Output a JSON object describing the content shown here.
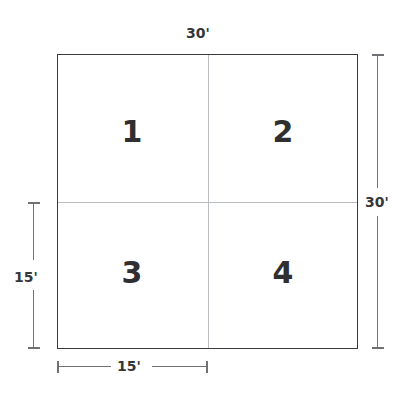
{
  "diagram": {
    "type": "floor-plan-quadrant-square",
    "shape": "square",
    "quadrants": [
      {
        "id": "1",
        "label": "1",
        "position": "top-left"
      },
      {
        "id": "2",
        "label": "2",
        "position": "top-right"
      },
      {
        "id": "3",
        "label": "3",
        "position": "bottom-left"
      },
      {
        "id": "4",
        "label": "4",
        "position": "bottom-right"
      }
    ],
    "dimensions": {
      "top": "30'",
      "right": "30'",
      "left": "15'",
      "bottom": "15'"
    },
    "colors": {
      "outline": "#3a3a3c",
      "divider": "#b9bcc0",
      "dimension_line": "#6f7175",
      "text": "#35363a",
      "number": "#2f2f31",
      "background": "#ffffff"
    }
  }
}
